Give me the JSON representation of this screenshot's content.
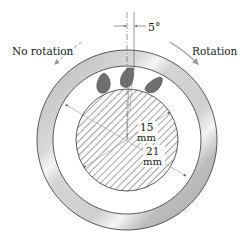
{
  "diagram": {
    "labels": {
      "no_rotation": "No rotation",
      "rotation": "Rotation",
      "angle": "5°",
      "shaft_dim_value": "15",
      "shaft_dim_unit": "mm",
      "ring_dim_value": "21",
      "ring_dim_unit": "mm"
    },
    "colors": {
      "ring_fill": "#c8c8c8",
      "ring_highlight": "#f2f2f2",
      "droplet_fill": "#6f6f6f",
      "hatch_stroke": "#555555",
      "outline": "#333333",
      "arrow": "#888888"
    }
  }
}
